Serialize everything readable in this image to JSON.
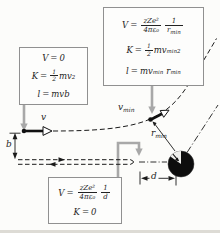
{
  "colors": {
    "connector_gray": "#a8a8a8",
    "box_border": "#909090",
    "ink": "#1e1e1e",
    "sphere": "#0d0d0d"
  },
  "boxes": {
    "initial": {
      "line1": {
        "lhs": "V",
        "eq": "=",
        "rhs": "0"
      },
      "line2": {
        "lhs": "K",
        "eq": "=",
        "frac_num": "1",
        "frac_den": "2",
        "body": "mv",
        "sup": "2"
      },
      "line3": {
        "lhs": "l",
        "eq": "=",
        "body": "mvb"
      }
    },
    "closest_approach": {
      "line1": {
        "lhs": "V",
        "eq": "=",
        "f1_num": "zZe²",
        "f1_den": "4πε₀",
        "f2_num": "1",
        "f2_den_base": "r",
        "f2_den_sub": "min"
      },
      "line2": {
        "lhs": "K",
        "eq": "=",
        "frac_num": "1",
        "frac_den": "2",
        "body": "mv",
        "body_sub": "min",
        "sup": "2"
      },
      "line3": {
        "lhs": "l",
        "eq": "=",
        "body": "mv",
        "body_sub": "min",
        "body2": "r",
        "body2_sub": "min"
      }
    },
    "head_on": {
      "line1": {
        "lhs": "V",
        "eq": "=",
        "f1_num": "zZe²",
        "f1_den": "4πε₀",
        "f2_num": "1",
        "f2_den": "d"
      },
      "line2": {
        "lhs": "K",
        "eq": "=",
        "rhs": "0"
      }
    }
  },
  "labels": {
    "v": "v",
    "b": "b",
    "v_min_base": "v",
    "v_min_sub": "min",
    "r_min_base": "r",
    "r_min_sub": "min",
    "d": "d"
  }
}
